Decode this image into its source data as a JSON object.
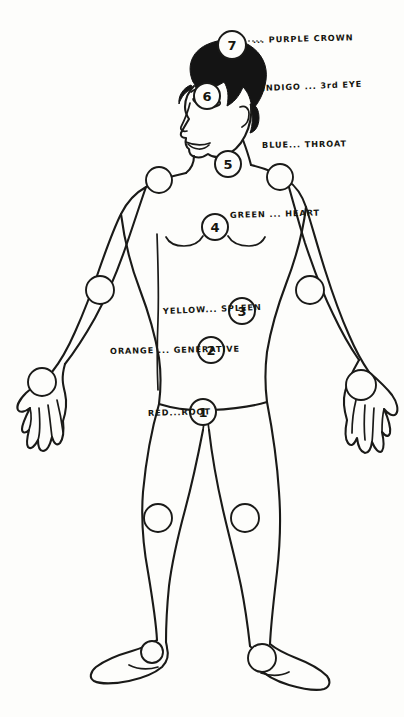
{
  "document": {
    "title": "Chakra Body Diagram",
    "style": "hand-drawn line illustration",
    "background_color": "#fdfdfb",
    "ink_color": "#1a1a18",
    "caption": ""
  },
  "chart_data": {
    "type": "diagram",
    "xlabel": "",
    "ylabel": "",
    "chakras": [
      {
        "number": "7",
        "color_name": "PURPLE",
        "location_name": "CROWN",
        "label": "... PURPLE  CROWN",
        "circle": {
          "cx": 232,
          "cy": 45,
          "r": 14
        },
        "label_pos": {
          "x": 253,
          "y": 36
        }
      },
      {
        "number": "6",
        "color_name": "INDIGO",
        "location_name": "3rd EYE",
        "label": "INDIGO ...  3rd EYE",
        "circle": {
          "cx": 207,
          "cy": 96,
          "r": 13
        },
        "label_pos": {
          "x": 262,
          "y": 84
        }
      },
      {
        "number": "5",
        "color_name": "BLUE",
        "location_name": "THROAT",
        "label": "BLUE...  THROAT",
        "circle": {
          "cx": 228,
          "cy": 164,
          "r": 13
        },
        "label_pos": {
          "x": 262,
          "y": 141
        }
      },
      {
        "number": "4",
        "color_name": "GREEN",
        "location_name": "HEART",
        "label": "GREEN ...  HEART",
        "circle": {
          "cx": 215,
          "cy": 227,
          "r": 13
        },
        "label_pos": {
          "x": 230,
          "y": 211
        }
      },
      {
        "number": "3",
        "color_name": "YELLOW",
        "location_name": "SPLEEN",
        "label": "YELLOW... SPLEEN",
        "circle": {
          "cx": 242,
          "cy": 311,
          "r": 13
        },
        "label_pos": {
          "x": 163,
          "y": 307
        }
      },
      {
        "number": "2",
        "color_name": "ORANGE",
        "location_name": "GENERATIVE",
        "label": "ORANGE ... GENERATIVE",
        "circle": {
          "cx": 211,
          "cy": 350,
          "r": 13
        },
        "label_pos": {
          "x": 110,
          "y": 347
        }
      },
      {
        "number": "1",
        "color_name": "RED",
        "location_name": "ROOT",
        "label": "RED...ROOT",
        "circle": {
          "cx": 203,
          "cy": 412,
          "r": 13
        },
        "label_pos": {
          "x": 148,
          "y": 409
        }
      }
    ],
    "joint_points": [
      {
        "name": "left-shoulder",
        "cx": 159,
        "cy": 180,
        "r": 13
      },
      {
        "name": "right-shoulder",
        "cx": 280,
        "cy": 177,
        "r": 13
      },
      {
        "name": "left-elbow",
        "cx": 100,
        "cy": 290,
        "r": 14
      },
      {
        "name": "right-elbow",
        "cx": 310,
        "cy": 290,
        "r": 14
      },
      {
        "name": "left-hand",
        "cx": 42,
        "cy": 382,
        "r": 14
      },
      {
        "name": "right-hand",
        "cx": 361,
        "cy": 385,
        "r": 15
      },
      {
        "name": "left-knee",
        "cx": 158,
        "cy": 518,
        "r": 14
      },
      {
        "name": "right-knee",
        "cx": 245,
        "cy": 518,
        "r": 14
      },
      {
        "name": "left-ankle",
        "cx": 152,
        "cy": 652,
        "r": 11
      },
      {
        "name": "right-ankle",
        "cx": 262,
        "cy": 658,
        "r": 14
      }
    ]
  }
}
